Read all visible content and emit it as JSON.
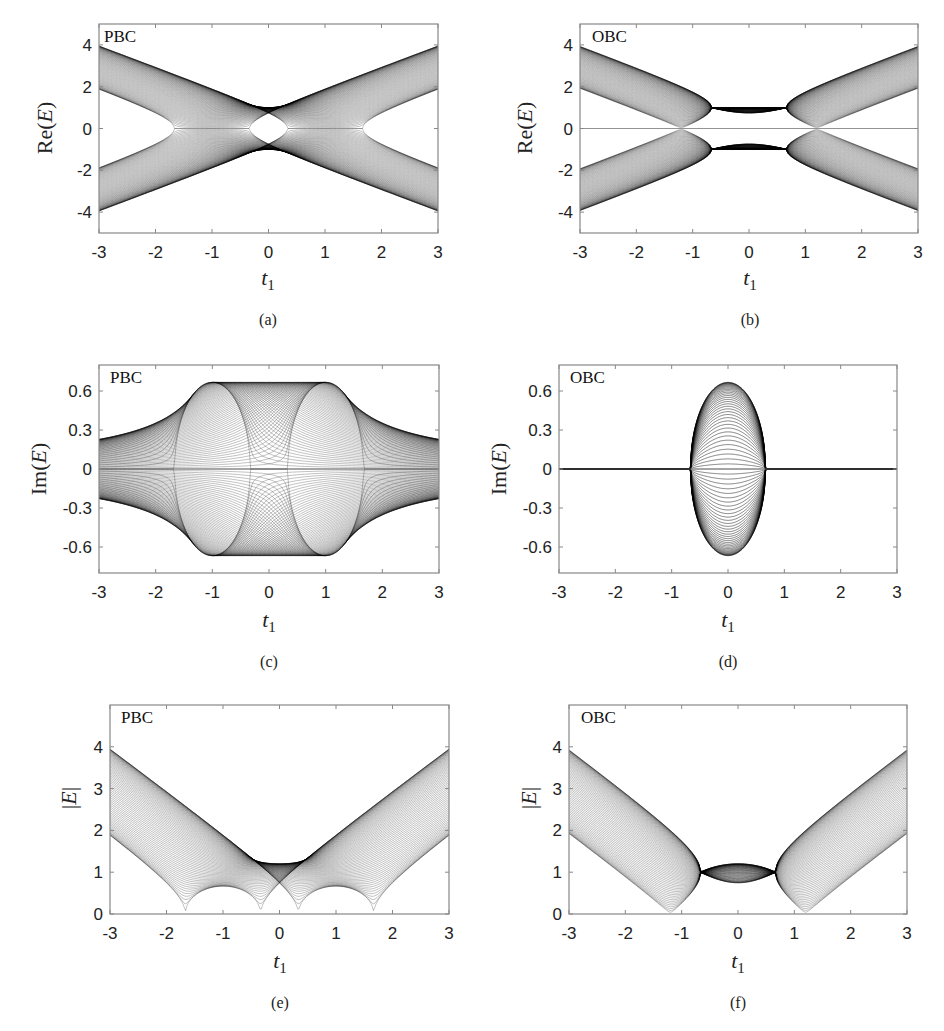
{
  "figure": {
    "panels": [
      {
        "id": "a",
        "caption": "(a)",
        "boundary_label": "PBC",
        "ylabel": "Re(E)",
        "xlabel": "t1"
      },
      {
        "id": "b",
        "caption": "(b)",
        "boundary_label": "OBC",
        "ylabel": "Re(E)",
        "xlabel": "t1"
      },
      {
        "id": "c",
        "caption": "(c)",
        "boundary_label": "PBC",
        "ylabel": "Im(E)",
        "xlabel": "t1"
      },
      {
        "id": "d",
        "caption": "(d)",
        "boundary_label": "OBC",
        "ylabel": "Im(E)",
        "xlabel": "t1"
      },
      {
        "id": "e",
        "caption": "(e)",
        "boundary_label": "PBC",
        "ylabel": "|E|",
        "xlabel": "t1"
      },
      {
        "id": "f",
        "caption": "(f)",
        "boundary_label": "OBC",
        "ylabel": "|E|",
        "xlabel": "t1"
      }
    ]
  },
  "chart_data": [
    {
      "id": "a",
      "type": "line",
      "title": "",
      "annotation": "PBC",
      "quantity": "re",
      "boundary": "pbc",
      "xlabel": "t1",
      "ylabel": "Re(E)",
      "xlim": [
        -3,
        3
      ],
      "ylim": [
        -5,
        5
      ],
      "xticks": [
        -3,
        -2,
        -1,
        0,
        1,
        2,
        3
      ],
      "yticks": [
        -4,
        -2,
        0,
        2,
        4
      ],
      "xtick_labels": [
        "-3",
        "-2",
        "-1",
        "0",
        "1",
        "2",
        "3"
      ],
      "ytick_labels": [
        "-4",
        "-2",
        "0",
        "2",
        "4"
      ],
      "description": "Band of energy curves; outer edges reach ±4.1 at t1=±3, inner edges ±1.7 at t1=±3; gaps close near t1=±1.85; central elliptical hole around t1∈[-0.55,0.55], |Re(E)|<0.8; bands cross at Re(E)=±1 near t1=0"
    },
    {
      "id": "b",
      "type": "line",
      "title": "",
      "annotation": "OBC",
      "quantity": "re",
      "boundary": "obc",
      "xlabel": "t1",
      "ylabel": "Re(E)",
      "xlim": [
        -3,
        3
      ],
      "ylim": [
        -5,
        5
      ],
      "xticks": [
        -3,
        -2,
        -1,
        0,
        1,
        2,
        3
      ],
      "yticks": [
        -4,
        -2,
        0,
        2,
        4
      ],
      "xtick_labels": [
        "-3",
        "-2",
        "-1",
        "0",
        "1",
        "2",
        "3"
      ],
      "ytick_labels": [
        "-4",
        "-2",
        "0",
        "2",
        "4"
      ],
      "description": "Bands touch Re(E)=0 at t1=±1.55; lens-shaped gap between with edges ±0.85 at t1=0; zero line across lens"
    },
    {
      "id": "c",
      "type": "line",
      "title": "",
      "annotation": "PBC",
      "quantity": "im",
      "boundary": "pbc",
      "xlabel": "t1",
      "ylabel": "Im(E)",
      "xlim": [
        -3,
        3
      ],
      "ylim": [
        -0.8,
        0.8
      ],
      "xticks": [
        -3,
        -2,
        -1,
        0,
        1,
        2,
        3
      ],
      "yticks": [
        -0.6,
        -0.3,
        0,
        0.3,
        0.6
      ],
      "xtick_labels": [
        "-3",
        "-2",
        "-1",
        "0",
        "1",
        "2",
        "3"
      ],
      "ytick_labels": [
        "-0.6",
        "-0.3",
        "0",
        "0.3",
        "0.6"
      ],
      "description": "Envelope ±0.18 at t1=±3, rises to ±0.66 plateau for |t1|<1.3; ellipses centered at t1=±1.15"
    },
    {
      "id": "d",
      "type": "line",
      "title": "",
      "annotation": "OBC",
      "quantity": "im",
      "boundary": "obc",
      "xlabel": "t1",
      "ylabel": "Im(E)",
      "xlim": [
        -3,
        3
      ],
      "ylim": [
        -0.8,
        0.8
      ],
      "xticks": [
        -3,
        -2,
        -1,
        0,
        1,
        2,
        3
      ],
      "yticks": [
        -0.6,
        -0.3,
        0,
        0.3,
        0.6
      ],
      "xtick_labels": [
        "-3",
        "-2",
        "-1",
        "0",
        "1",
        "2",
        "3"
      ],
      "ytick_labels": [
        "-0.6",
        "-0.3",
        "0",
        "0.3",
        "0.6"
      ],
      "description": "Diamond-shaped region between t1=-1.55 and 1.55 with extremes ±0.66 at t1=0; Im(E)=0 outside"
    },
    {
      "id": "e",
      "type": "line",
      "title": "",
      "annotation": "PBC",
      "quantity": "abs",
      "boundary": "pbc",
      "xlabel": "t1",
      "ylabel": "|E|",
      "xlim": [
        -3,
        3
      ],
      "ylim": [
        0,
        5
      ],
      "xticks": [
        -3,
        -2,
        -1,
        0,
        1,
        2,
        3
      ],
      "yticks": [
        0,
        1,
        2,
        3,
        4
      ],
      "xtick_labels": [
        "-3",
        "-2",
        "-1",
        "0",
        "1",
        "2",
        "3"
      ],
      "ytick_labels": [
        "0",
        "1",
        "2",
        "3",
        "4"
      ],
      "description": "Upper edge |E|≈4.1 at t1=±3; lower edge 1.7 at ±3; touches 0 at t1=±1.85 and ±0.55; arcs peaking ~0.7 at t1=±1.2; converge to |E|=1 at t1=0"
    },
    {
      "id": "f",
      "type": "line",
      "title": "",
      "annotation": "OBC",
      "quantity": "abs",
      "boundary": "obc",
      "xlabel": "t1",
      "ylabel": "|E|",
      "xlim": [
        -3,
        3
      ],
      "ylim": [
        0,
        5
      ],
      "xticks": [
        -3,
        -2,
        -1,
        0,
        1,
        2,
        3
      ],
      "yticks": [
        0,
        1,
        2,
        3,
        4
      ],
      "xtick_labels": [
        "-3",
        "-2",
        "-1",
        "0",
        "1",
        "2",
        "3"
      ],
      "ytick_labels": [
        "0",
        "1",
        "2",
        "3",
        "4"
      ],
      "description": "Bands touch 0 at t1=±1.55; arc peaking |E|=1 at t1=0; upper edge 4.1 at t1=±3, lower edge 1.7"
    }
  ]
}
